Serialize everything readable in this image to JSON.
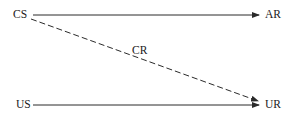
{
  "diagram": {
    "type": "classical-conditioning",
    "colors": {
      "stroke": "#2a2a2a",
      "text": "#1a1a1a",
      "background": "#ffffff"
    },
    "nodes": {
      "cs": {
        "label": "CS"
      },
      "ar": {
        "label": "AR"
      },
      "cr": {
        "label": "CR"
      },
      "us": {
        "label": "US"
      },
      "ur": {
        "label": "UR"
      }
    },
    "edges": [
      {
        "from": "CS",
        "to": "AR",
        "style": "solid"
      },
      {
        "from": "CS",
        "to": "UR",
        "style": "dashed",
        "label": "CR"
      },
      {
        "from": "US",
        "to": "UR",
        "style": "solid"
      }
    ]
  }
}
